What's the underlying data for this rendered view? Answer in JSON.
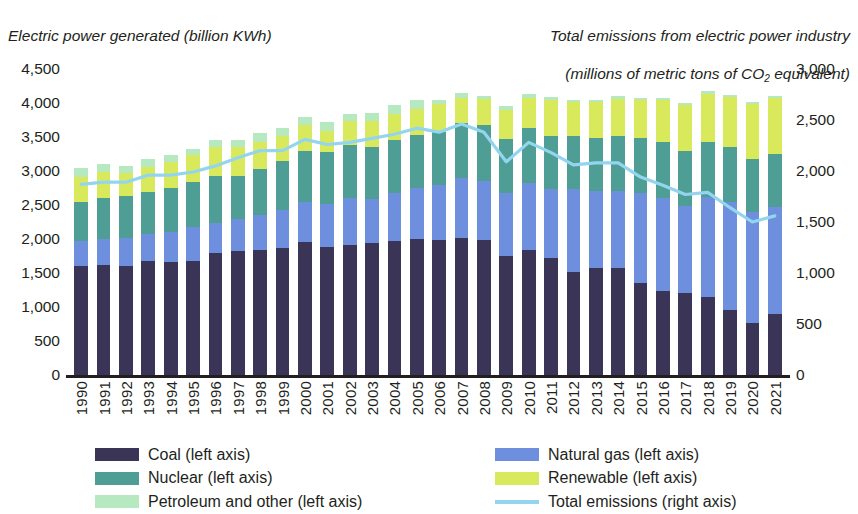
{
  "titles": {
    "left_axis": "Electric power generated (billion KWh)",
    "right_axis_line1": "Total emissions from electric power industry",
    "right_axis_line2_pre": "(millions of metric tons of CO",
    "right_axis_line2_sub": "2",
    "right_axis_line2_post": " equivalent)"
  },
  "legend": {
    "left_column": [
      {
        "label": "Coal (left axis)",
        "color": "#3a3457",
        "type": "swatch",
        "key": "coal"
      },
      {
        "label": "Nuclear (left axis)",
        "color": "#4f9e96",
        "type": "swatch",
        "key": "nuclear"
      },
      {
        "label": "Petroleum and other (left axis)",
        "color": "#b6e9bf",
        "type": "swatch",
        "key": "petroleum"
      }
    ],
    "right_column": [
      {
        "label": "Natural gas (left axis)",
        "color": "#6e8fdd",
        "type": "swatch",
        "key": "gas"
      },
      {
        "label": "Renewable (left axis)",
        "color": "#d8ea5c",
        "type": "swatch",
        "key": "renewable"
      },
      {
        "label": "Total emissions (right axis)",
        "color": "#93d5ee",
        "type": "line",
        "key": "emissions"
      }
    ]
  },
  "chart_data": {
    "type": "bar",
    "subtype": "stacked-bar-with-line",
    "title": "",
    "xlabel": "",
    "ylabel": "Electric power generated (billion KWh)",
    "y2label": "Total emissions from electric power industry (millions of metric tons of CO2 equivalent)",
    "grid": false,
    "legend_position": "bottom",
    "ylim": [
      0,
      4500
    ],
    "y2lim": [
      0,
      3000
    ],
    "yticks": [
      "0",
      "500",
      "1,000",
      "1,500",
      "2,000",
      "2,500",
      "3,000",
      "3,500",
      "4,000",
      "4,500"
    ],
    "y2ticks": [
      "0",
      "500",
      "1,000",
      "1,500",
      "2,000",
      "2,500",
      "3,000"
    ],
    "categories": [
      "1990",
      "1991",
      "1992",
      "1993",
      "1994",
      "1995",
      "1996",
      "1997",
      "1998",
      "1999",
      "2000",
      "2001",
      "2002",
      "2003",
      "2004",
      "2005",
      "2006",
      "2007",
      "2008",
      "2009",
      "2010",
      "2011",
      "2012",
      "2013",
      "2014",
      "2015",
      "2016",
      "2017",
      "2018",
      "2019",
      "2020",
      "2021"
    ],
    "series": [
      {
        "name": "Coal (left axis)",
        "axis": "left",
        "color": "#3a3457",
        "values": [
          1600,
          1620,
          1610,
          1670,
          1660,
          1680,
          1790,
          1820,
          1840,
          1870,
          1950,
          1880,
          1910,
          1940,
          1970,
          2000,
          1980,
          2010,
          1980,
          1750,
          1840,
          1720,
          1510,
          1580,
          1580,
          1350,
          1230,
          1200,
          1150,
          960,
          770,
          900
        ]
      },
      {
        "name": "Natural gas (left axis)",
        "axis": "left",
        "color": "#6e8fdd",
        "values": [
          370,
          380,
          400,
          410,
          450,
          490,
          450,
          470,
          520,
          550,
          600,
          630,
          690,
          650,
          700,
          750,
          810,
          890,
          880,
          920,
          990,
          1010,
          1230,
          1120,
          1130,
          1330,
          1380,
          1290,
          1470,
          1580,
          1620,
          1570
        ]
      },
      {
        "name": "Nuclear (left axis)",
        "axis": "left",
        "color": "#4f9e96",
        "values": [
          580,
          610,
          620,
          610,
          640,
          670,
          680,
          630,
          670,
          730,
          750,
          770,
          780,
          760,
          790,
          780,
          790,
          810,
          810,
          800,
          810,
          790,
          770,
          790,
          800,
          800,
          810,
          800,
          810,
          810,
          790,
          780
        ]
      },
      {
        "name": "Renewable (left axis)",
        "axis": "left",
        "color": "#d8ea5c",
        "values": [
          360,
          380,
          340,
          370,
          380,
          400,
          440,
          430,
          400,
          370,
          370,
          310,
          360,
          380,
          380,
          380,
          400,
          370,
          390,
          430,
          440,
          530,
          500,
          530,
          550,
          560,
          620,
          680,
          710,
          740,
          800,
          830
        ]
      },
      {
        "name": "Petroleum and other (left axis)",
        "axis": "left",
        "color": "#b6e9bf",
        "values": [
          130,
          120,
          110,
          120,
          110,
          90,
          90,
          100,
          130,
          120,
          120,
          130,
          100,
          130,
          130,
          130,
          70,
          70,
          50,
          50,
          50,
          40,
          30,
          30,
          40,
          40,
          30,
          30,
          30,
          30,
          30,
          30
        ]
      },
      {
        "name": "Total emissions (right axis)",
        "axis": "right",
        "color": "#93d5ee",
        "values": [
          1870,
          1890,
          1890,
          1960,
          1960,
          1990,
          2050,
          2130,
          2200,
          2200,
          2310,
          2260,
          2280,
          2320,
          2360,
          2420,
          2380,
          2460,
          2380,
          2090,
          2280,
          2180,
          2060,
          2080,
          2080,
          1940,
          1860,
          1770,
          1790,
          1640,
          1500,
          1560
        ]
      }
    ]
  }
}
